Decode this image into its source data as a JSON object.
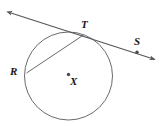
{
  "figure": {
    "background_color": "#ffffff",
    "stroke_color": "#55555a",
    "label_color": "#161616",
    "point_color": "#55555a"
  },
  "circle": {
    "name": "circle-x",
    "center_label": "X",
    "center_x": 68.5,
    "center_y": 76,
    "radius": 44,
    "stroke_color": "#6a6a70",
    "stroke_width": 1
  },
  "points": [
    {
      "id": "point-t",
      "label": "T",
      "x": 83,
      "y": 35,
      "label_x": 81,
      "label_y": 20,
      "marked": false,
      "description": "tangent point on circle"
    },
    {
      "id": "point-s",
      "label": "S",
      "x": 137,
      "y": 52,
      "label_x": 134,
      "label_y": 36,
      "marked": true,
      "description": "point on tangent line right of T"
    },
    {
      "id": "point-r",
      "label": "R",
      "x": 26.5,
      "y": 73,
      "label_x": 10,
      "label_y": 65,
      "marked": false,
      "description": "point on circle, endpoint of chord"
    },
    {
      "id": "point-x",
      "label": "X",
      "x": 68.5,
      "y": 76,
      "label_x": 70,
      "label_y": 75,
      "marked": true,
      "description": "center of circle"
    }
  ],
  "lines": [
    {
      "id": "tangent-line",
      "label": "tangent line through T and S",
      "x1": 10,
      "y1": 12.5,
      "x2": 156,
      "y2": 60,
      "arrow_start": true,
      "arrow_end": true,
      "stroke_color": "#55555a",
      "stroke_width": 1.1
    },
    {
      "id": "chord-rt",
      "label": "chord R to T",
      "x1": 26.5,
      "y1": 73,
      "x2": 83.5,
      "y2": 35,
      "arrow_start": false,
      "arrow_end": false,
      "stroke_color": "#6a6a70",
      "stroke_width": 1
    }
  ],
  "labels": {
    "t": "T",
    "s": "S",
    "r": "R",
    "x": "X"
  }
}
